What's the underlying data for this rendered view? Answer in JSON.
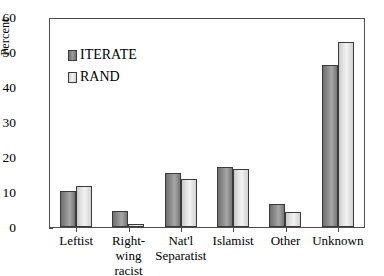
{
  "chart_data": {
    "type": "bar",
    "title": "",
    "xlabel": "",
    "ylabel": "Percent",
    "ylim": [
      0,
      60
    ],
    "yticks": [
      0,
      10,
      20,
      30,
      40,
      50,
      60
    ],
    "grid": false,
    "legend_position": "upper-left-inside",
    "categories": [
      "Leftist",
      "Right-wing\nracist",
      "Nat'l\nSeparatist",
      "Islamist",
      "Other",
      "Unknown"
    ],
    "series": [
      {
        "name": "ITERATE",
        "values": [
          10.2,
          4.5,
          15.3,
          17.2,
          6.5,
          46.3
        ],
        "color": "#8d8d8d"
      },
      {
        "name": "RAND",
        "values": [
          11.7,
          0.8,
          13.8,
          16.7,
          4.2,
          52.9
        ],
        "color": "#e4e4e4"
      }
    ]
  },
  "legend": {
    "items": [
      {
        "label": "ITERATE"
      },
      {
        "label": "RAND"
      }
    ]
  },
  "axes": {
    "y_title": "Percent",
    "y_tick_labels": [
      "60",
      "50",
      "40",
      "30",
      "20",
      "10",
      "0"
    ]
  }
}
